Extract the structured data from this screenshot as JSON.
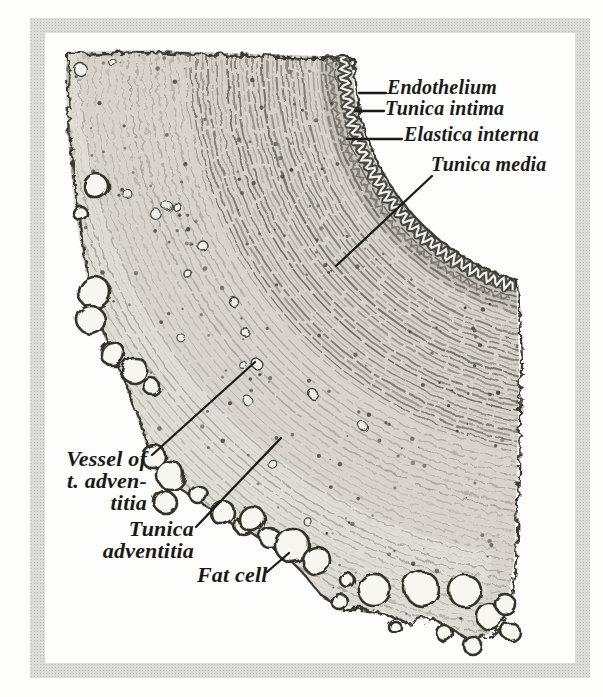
{
  "figure": {
    "type": "histology-labeled-illustration",
    "subject": "Cross section of an artery wall",
    "frame_color": "#cfcfcd",
    "page_background": "#fdfdfb",
    "tissue_base_color": "#d8d4cd",
    "label_color": "#1a1a18",
    "labels": {
      "endothelium": "Endothelium",
      "tunica_intima": "Tunica intima",
      "elastica_interna": "Elastica interna",
      "tunica_media": "Tunica media",
      "vessel_line1": "Vessel of",
      "vessel_line2": "t. adven-",
      "vessel_line3": "titia",
      "tunica_adventitia_line1": "Tunica",
      "tunica_adventitia_line2": "adventitia",
      "fat_cell": "Fat cell"
    },
    "leader_lines": [
      {
        "name": "endothelium-leader",
        "x1": 359,
        "y1": 93,
        "x2": 386,
        "y2": 93
      },
      {
        "name": "tunica-intima-leader",
        "x1": 355,
        "y1": 111,
        "x2": 384,
        "y2": 111
      },
      {
        "name": "elastica-interna-leader",
        "x1": 347,
        "y1": 139,
        "x2": 402,
        "y2": 139
      },
      {
        "name": "tunica-media-leader",
        "x1": 336,
        "y1": 266,
        "x2": 432,
        "y2": 176
      },
      {
        "name": "vessel-leader",
        "x1": 255,
        "y1": 362,
        "x2": 152,
        "y2": 455
      },
      {
        "name": "tunica-adventitia-leader",
        "x1": 281,
        "y1": 438,
        "x2": 196,
        "y2": 527
      },
      {
        "name": "fat-cell-leader",
        "x1": 289,
        "y1": 553,
        "x2": 267,
        "y2": 572
      }
    ],
    "geometry": {
      "cx": 580,
      "cy": 60,
      "lumen_r": 228,
      "lumen_a1": 180.8,
      "lumen_a2": 106.3,
      "media_r": [
        230,
        398
      ],
      "adventitia_r": [
        404,
        608
      ],
      "outline_pre": [
        [
          67,
          52
        ],
        [
          150,
          50
        ],
        [
          250,
          54
        ],
        [
          352,
          57
        ]
      ],
      "outline_post": [
        [
          516,
          279
        ],
        [
          519,
          360
        ],
        [
          517,
          470
        ],
        [
          514,
          560
        ],
        [
          508,
          600
        ],
        [
          500,
          622
        ],
        [
          488,
          634
        ],
        [
          470,
          640
        ],
        [
          452,
          628
        ],
        [
          430,
          616
        ],
        [
          405,
          622
        ],
        [
          385,
          612
        ],
        [
          360,
          607
        ],
        [
          338,
          607
        ],
        [
          318,
          592
        ],
        [
          300,
          570
        ],
        [
          282,
          552
        ],
        [
          262,
          540
        ],
        [
          246,
          528
        ],
        [
          228,
          520
        ],
        [
          208,
          506
        ],
        [
          188,
          494
        ],
        [
          168,
          480
        ],
        [
          155,
          464
        ],
        [
          146,
          445
        ],
        [
          136,
          415
        ],
        [
          122,
          378
        ],
        [
          106,
          342
        ],
        [
          95,
          312
        ],
        [
          87,
          278
        ],
        [
          79,
          236
        ],
        [
          73,
          192
        ],
        [
          68,
          140
        ],
        [
          66,
          90
        ]
      ]
    },
    "fat_cells": [
      [
        95,
        185,
        12
      ],
      [
        78,
        211,
        7
      ],
      [
        93,
        291,
        16
      ],
      [
        89,
        318,
        14
      ],
      [
        111,
        352,
        12
      ],
      [
        133,
        369,
        13
      ],
      [
        150,
        385,
        8
      ],
      [
        152,
        455,
        12
      ],
      [
        169,
        474,
        14
      ],
      [
        163,
        500,
        11
      ],
      [
        197,
        493,
        9
      ],
      [
        221,
        511,
        12
      ],
      [
        243,
        524,
        10
      ],
      [
        250,
        517,
        13
      ],
      [
        268,
        536,
        10
      ],
      [
        290,
        543,
        17
      ],
      [
        315,
        559,
        14
      ],
      [
        345,
        578,
        7
      ],
      [
        338,
        600,
        8
      ],
      [
        372,
        588,
        16
      ],
      [
        393,
        625,
        6
      ],
      [
        420,
        587,
        17
      ],
      [
        443,
        632,
        8
      ],
      [
        463,
        589,
        16
      ],
      [
        488,
        615,
        13
      ],
      [
        470,
        643,
        9
      ],
      [
        503,
        602,
        10
      ],
      [
        509,
        630,
        9
      ]
    ],
    "vessel_rings": [
      [
        255,
        362,
        5
      ],
      [
        78,
        67,
        6.5
      ],
      [
        243,
        330,
        4
      ],
      [
        312,
        393,
        4.5
      ],
      [
        175,
        205,
        4
      ],
      [
        200,
        243,
        5
      ],
      [
        186,
        272,
        4
      ],
      [
        232,
        300,
        4.5
      ]
    ]
  }
}
